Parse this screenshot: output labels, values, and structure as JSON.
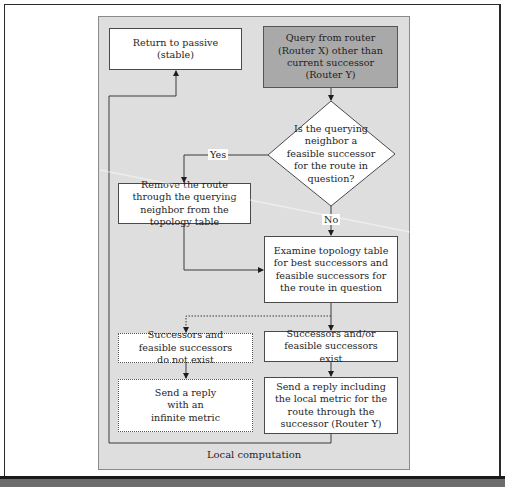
{
  "diagram": {
    "caption": "Local computation",
    "nodes": {
      "return_passive": "Return to passive (stable)",
      "query": "Query from router (Router X) other than current successor (Router Y)",
      "decision": "Is the querying neighbor a feasible successor for the route in question?",
      "remove_route": "Remove the route through the querying neighbor from the topology table",
      "examine": "Examine topology table for best successors and feasible successors for the route in question",
      "not_exist": "Successors and feasible successors do not exist",
      "exist": "Successors and/or feasible successors exist",
      "reply_infinite": "Send a reply with an infinite metric",
      "reply_local": "Send a reply including the local metric for the route through the successor (Router Y)"
    },
    "edge_labels": {
      "yes": "Yes",
      "no": "No"
    },
    "colors": {
      "panel": "#dedede",
      "start_node": "#a9a9a9",
      "node": "#ffffff",
      "line": "#3a3a3a"
    }
  }
}
